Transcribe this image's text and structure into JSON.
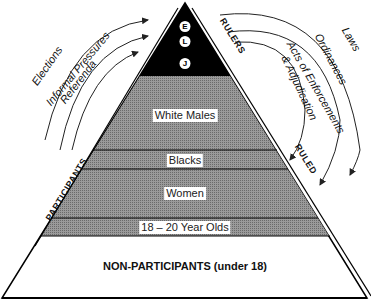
{
  "pyramid": {
    "apex_letters": [
      "E",
      "L",
      "J"
    ],
    "bands": [
      {
        "label": "White Males"
      },
      {
        "label": "Blacks"
      },
      {
        "label": "Women"
      },
      {
        "label": "18 – 20 Year Olds"
      }
    ],
    "base_label": "NON-PARTICIPANTS (under 18)",
    "colors": {
      "apex": "#000000",
      "band": "#8a8a8a",
      "base": "#ffffff"
    }
  },
  "left_side": {
    "bracket_label": "PARTICIPANTS",
    "arrows": [
      "Elections",
      "Informal Pressures",
      "Referenda"
    ]
  },
  "right_side": {
    "top_bracket_label": "RULERS",
    "bottom_bracket_label": "RULED",
    "arrows": [
      "Laws",
      "Ordinances",
      "Acts of Enforcements",
      "& Adjudication"
    ]
  }
}
